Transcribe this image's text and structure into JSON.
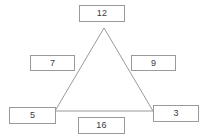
{
  "diagram": {
    "shape": {
      "name": "triangle",
      "stroke_color": "#9a9a9a",
      "fill_color": "#ffffff",
      "vertices": {
        "apex": {
          "x": 104,
          "y": 28
        },
        "bottom_left": {
          "x": 55,
          "y": 111
        },
        "bottom_right": {
          "x": 153,
          "y": 111
        }
      }
    },
    "boxes": [
      {
        "id": "top",
        "value": "12",
        "position": "above-apex"
      },
      {
        "id": "left",
        "value": "7",
        "position": "left-side"
      },
      {
        "id": "right",
        "value": "9",
        "position": "right-side"
      },
      {
        "id": "bottom_left",
        "value": "5",
        "position": "lower-left-vertex"
      },
      {
        "id": "bottom_right",
        "value": "3",
        "position": "lower-right-vertex"
      },
      {
        "id": "bottom",
        "value": "16",
        "position": "below-base"
      }
    ],
    "colors": {
      "box_border": "#9a9a9a",
      "box_fill": "#ffffff",
      "text": "#3a3a3a",
      "background": "#ffffff"
    }
  }
}
